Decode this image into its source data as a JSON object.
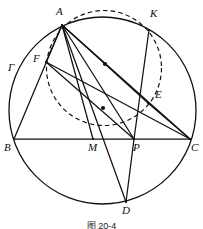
{
  "figure": {
    "caption": "图 20-4",
    "circle_label": "Γ",
    "stroke_color": "#111111",
    "background_color": "#ffffff"
  },
  "geometry": {
    "main_circle": {
      "cx": 102.5,
      "cy": 110.5,
      "r": 93.5,
      "style": "solid"
    },
    "dashed_circle": {
      "cx": 104,
      "cy": 68,
      "r": 57.5,
      "style": "dashed"
    },
    "points": [
      {
        "name": "A",
        "x": 62,
        "y": 25,
        "label_x": 56,
        "label_y": 6
      },
      {
        "name": "K",
        "x": 149,
        "y": 30,
        "label_x": 150,
        "label_y": 8
      },
      {
        "name": "F",
        "x": 46,
        "y": 62,
        "label_x": 33,
        "label_y": 53
      },
      {
        "name": "E",
        "x": 148,
        "y": 103,
        "label_x": 155,
        "label_y": 89
      },
      {
        "name": "B",
        "x": 14,
        "y": 139,
        "label_x": 4,
        "label_y": 142
      },
      {
        "name": "M",
        "x": 93,
        "y": 139,
        "label_x": 88,
        "label_y": 142
      },
      {
        "name": "P",
        "x": 134,
        "y": 139,
        "label_x": 133,
        "label_y": 142
      },
      {
        "name": "C",
        "x": 190,
        "y": 139,
        "label_x": 191,
        "label_y": 142
      },
      {
        "name": "D",
        "x": 126,
        "y": 202,
        "label_x": 122,
        "label_y": 205
      }
    ],
    "gamma_label": {
      "x": 8,
      "y": 62
    },
    "segments": [
      {
        "name": "BC",
        "from": "B",
        "to": "C"
      },
      {
        "name": "AB",
        "from": "A",
        "to": "B"
      },
      {
        "name": "AC",
        "from": "A",
        "to": "C"
      },
      {
        "name": "AD",
        "from": "A",
        "to": "D"
      },
      {
        "name": "AM",
        "from": "A",
        "to": "M"
      },
      {
        "name": "AP",
        "from": "A",
        "to": "P"
      },
      {
        "name": "AE",
        "from": "A",
        "to": "E"
      },
      {
        "name": "AF",
        "from": "A",
        "to": "F"
      },
      {
        "name": "FC",
        "from": "F",
        "to": "C"
      },
      {
        "name": "FP",
        "from": "F",
        "to": "P"
      },
      {
        "name": "KP",
        "from": "K",
        "to": "P"
      },
      {
        "name": "PD",
        "from": "P",
        "to": "D"
      },
      {
        "name": "EC",
        "from": "E",
        "to": "C"
      }
    ],
    "midpoint_dots": [
      {
        "name": "midpoint-dot-AE",
        "x": 105,
        "y": 64
      },
      {
        "name": "midpoint-dot-FC",
        "x": 103,
        "y": 108
      }
    ]
  }
}
